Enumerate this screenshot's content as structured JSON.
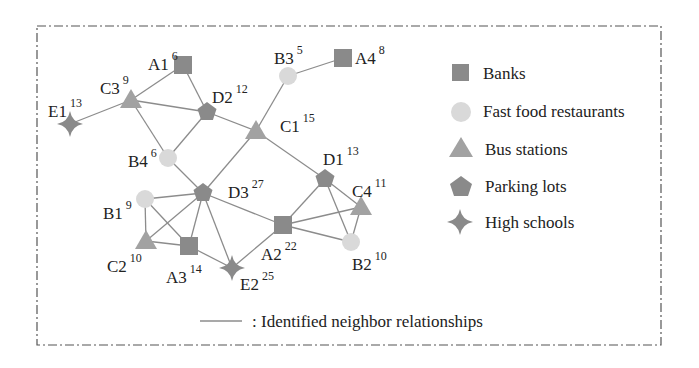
{
  "colors": {
    "border": "#555555",
    "edge": "#8c8c8c",
    "bank": "#8a8a8a",
    "fast_food": "#d9d9d9",
    "bus_station": "#a2a2a2",
    "parking_lot": "#8a8a8a",
    "high_school": "#8a8a8a"
  },
  "legend": {
    "items": [
      {
        "type": "bank",
        "icon": "square-icon",
        "label": "Banks"
      },
      {
        "type": "fast_food",
        "icon": "circle-icon",
        "label": "Fast food restaurants"
      },
      {
        "type": "bus_station",
        "icon": "triangle-icon",
        "label": "Bus stations"
      },
      {
        "type": "parking_lot",
        "icon": "pentagon-icon",
        "label": "Parking lots"
      },
      {
        "type": "high_school",
        "icon": "star-icon",
        "label": "High schools"
      }
    ],
    "edge_label": ": Identified neighbor relationships"
  },
  "nodes": [
    {
      "id": "A1",
      "type": "bank",
      "sup": "6",
      "x": 183,
      "y": 65,
      "lx": 148,
      "ly": 70
    },
    {
      "id": "A2",
      "type": "bank",
      "sup": "22",
      "x": 283,
      "y": 225,
      "lx": 261,
      "ly": 260
    },
    {
      "id": "A3",
      "type": "bank",
      "sup": "14",
      "x": 189,
      "y": 246,
      "lx": 166,
      "ly": 283
    },
    {
      "id": "A4",
      "type": "bank",
      "sup": "8",
      "x": 343,
      "y": 58,
      "lx": 355,
      "ly": 64
    },
    {
      "id": "B1",
      "type": "fast_food",
      "sup": "9",
      "x": 145,
      "y": 199,
      "lx": 103,
      "ly": 219
    },
    {
      "id": "B2",
      "type": "fast_food",
      "sup": "10",
      "x": 351,
      "y": 242,
      "lx": 352,
      "ly": 270
    },
    {
      "id": "B3",
      "type": "fast_food",
      "sup": "5",
      "x": 288,
      "y": 76,
      "lx": 274,
      "ly": 64
    },
    {
      "id": "B4",
      "type": "fast_food",
      "sup": "6",
      "x": 168,
      "y": 158,
      "lx": 128,
      "ly": 167
    },
    {
      "id": "C1",
      "type": "bus_station",
      "sup": "15",
      "x": 256,
      "y": 131,
      "lx": 280,
      "ly": 132
    },
    {
      "id": "C2",
      "type": "bus_station",
      "sup": "10",
      "x": 146,
      "y": 241,
      "lx": 107,
      "ly": 272
    },
    {
      "id": "C3",
      "type": "bus_station",
      "sup": "9",
      "x": 131,
      "y": 100,
      "lx": 100,
      "ly": 94
    },
    {
      "id": "C4",
      "type": "bus_station",
      "sup": "11",
      "x": 361,
      "y": 207,
      "lx": 352,
      "ly": 197
    },
    {
      "id": "D1",
      "type": "parking_lot",
      "sup": "13",
      "x": 325,
      "y": 179,
      "lx": 323,
      "ly": 165
    },
    {
      "id": "D2",
      "type": "parking_lot",
      "sup": "12",
      "x": 207,
      "y": 112,
      "lx": 212,
      "ly": 103
    },
    {
      "id": "D3",
      "type": "parking_lot",
      "sup": "27",
      "x": 203,
      "y": 193,
      "lx": 228,
      "ly": 198
    },
    {
      "id": "E1",
      "type": "high_school",
      "sup": "13",
      "x": 70,
      "y": 124,
      "lx": 48,
      "ly": 117
    },
    {
      "id": "E2",
      "type": "high_school",
      "sup": "25",
      "x": 232,
      "y": 268,
      "lx": 240,
      "ly": 290
    }
  ],
  "edges": [
    [
      "E1",
      "C3"
    ],
    [
      "C3",
      "A1"
    ],
    [
      "C3",
      "D2"
    ],
    [
      "C3",
      "B4"
    ],
    [
      "A1",
      "D2"
    ],
    [
      "D2",
      "B4"
    ],
    [
      "D2",
      "C1"
    ],
    [
      "B4",
      "D3"
    ],
    [
      "C1",
      "D3"
    ],
    [
      "C1",
      "B3"
    ],
    [
      "B3",
      "A4"
    ],
    [
      "C1",
      "D1"
    ],
    [
      "D3",
      "B1"
    ],
    [
      "D3",
      "C2"
    ],
    [
      "D3",
      "A3"
    ],
    [
      "D3",
      "E2"
    ],
    [
      "D3",
      "A2"
    ],
    [
      "B1",
      "C2"
    ],
    [
      "B1",
      "A3"
    ],
    [
      "C2",
      "A3"
    ],
    [
      "A3",
      "E2"
    ],
    [
      "A2",
      "E2"
    ],
    [
      "A2",
      "D1"
    ],
    [
      "A2",
      "C4"
    ],
    [
      "A2",
      "B2"
    ],
    [
      "D1",
      "C4"
    ],
    [
      "D1",
      "B2"
    ],
    [
      "C4",
      "B2"
    ]
  ]
}
